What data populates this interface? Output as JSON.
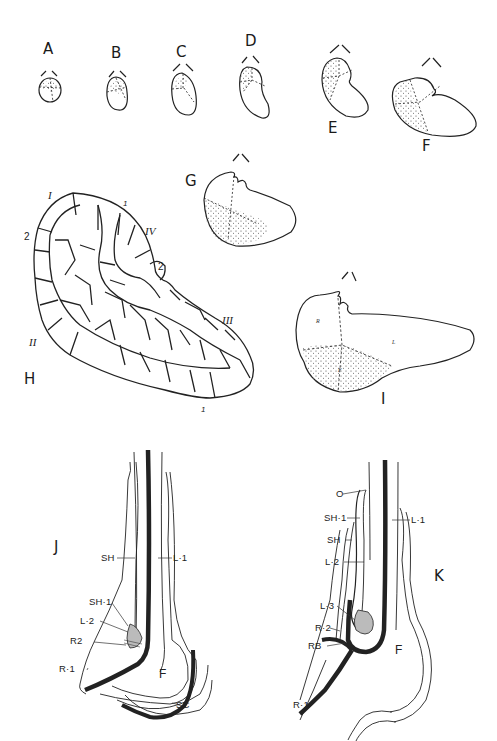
{
  "figure": {
    "panels": [
      {
        "id": "A",
        "label": "A"
      },
      {
        "id": "B",
        "label": "B"
      },
      {
        "id": "C",
        "label": "C"
      },
      {
        "id": "D",
        "label": "D"
      },
      {
        "id": "E",
        "label": "E"
      },
      {
        "id": "F",
        "label": "F"
      },
      {
        "id": "G",
        "label": "G"
      },
      {
        "id": "H",
        "label": "H"
      },
      {
        "id": "I",
        "label": "I"
      },
      {
        "id": "J",
        "label": "J"
      },
      {
        "id": "K",
        "label": "K"
      }
    ],
    "panel_h": {
      "roman_labels": [
        "I",
        "II",
        "III",
        "IV"
      ],
      "number_labels": [
        "1",
        "2",
        "2",
        "1",
        "1"
      ]
    },
    "panel_i": {
      "region_labels": [
        "R",
        "L",
        "F"
      ]
    },
    "panel_j": {
      "labels": [
        "SH",
        "L·1",
        "SH·1",
        "L·2",
        "R2",
        "R·1",
        "F",
        "SC"
      ]
    },
    "panel_k": {
      "labels": [
        "O",
        "SH·1",
        "SH",
        "L·2",
        "L·3",
        "R·2",
        "RB",
        "R·1",
        "L·1",
        "F"
      ]
    }
  }
}
